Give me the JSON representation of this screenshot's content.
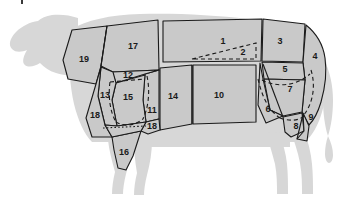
{
  "diagram": {
    "colors": {
      "background": "#ffffff",
      "silhouette": "#d7d7d7",
      "cut_fill": "#c9c9c9",
      "outline": "#1a1a1a",
      "label_text": "#1a1a1a"
    },
    "label_count": "19",
    "cuts": [
      {
        "id": "1",
        "label": "1",
        "x": 223,
        "y": 42,
        "size": "normal"
      },
      {
        "id": "2",
        "label": "2",
        "x": 243,
        "y": 53,
        "size": "normal"
      },
      {
        "id": "3",
        "label": "3",
        "x": 280,
        "y": 42,
        "size": "normal"
      },
      {
        "id": "4",
        "label": "4",
        "x": 315,
        "y": 57,
        "size": "normal"
      },
      {
        "id": "5",
        "label": "5",
        "x": 285,
        "y": 70,
        "size": "normal"
      },
      {
        "id": "6",
        "label": "6",
        "x": 268,
        "y": 110,
        "size": "normal"
      },
      {
        "id": "7",
        "label": "7",
        "x": 290,
        "y": 90,
        "size": "normal"
      },
      {
        "id": "8",
        "label": "8",
        "x": 296,
        "y": 127,
        "size": "normal"
      },
      {
        "id": "9",
        "label": "9",
        "x": 311,
        "y": 118,
        "size": "normal"
      },
      {
        "id": "10",
        "label": "10",
        "x": 219,
        "y": 96,
        "size": "normal"
      },
      {
        "id": "11",
        "label": "11",
        "x": 152,
        "y": 111,
        "size": "normal"
      },
      {
        "id": "12",
        "label": "12",
        "x": 128,
        "y": 76,
        "size": "normal"
      },
      {
        "id": "13",
        "label": "13",
        "x": 105,
        "y": 96,
        "size": "normal"
      },
      {
        "id": "14",
        "label": "14",
        "x": 173,
        "y": 97,
        "size": "normal"
      },
      {
        "id": "15",
        "label": "15",
        "x": 128,
        "y": 98,
        "size": "normal"
      },
      {
        "id": "16",
        "label": "16",
        "x": 124,
        "y": 153,
        "size": "normal"
      },
      {
        "id": "17",
        "label": "17",
        "x": 133,
        "y": 47,
        "size": "normal"
      },
      {
        "id": "18",
        "label": "18",
        "x": 95,
        "y": 116,
        "size": "normal"
      },
      {
        "id": "19",
        "label": "19",
        "x": 84,
        "y": 60,
        "size": "normal"
      },
      {
        "id": "18b",
        "label": "18",
        "x": 152,
        "y": 127,
        "size": "normal"
      }
    ]
  }
}
